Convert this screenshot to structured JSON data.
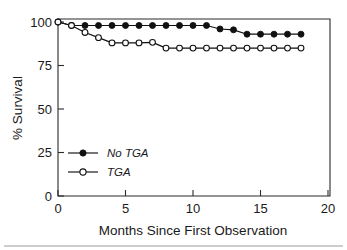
{
  "chart_data": {
    "type": "line",
    "title": "",
    "subtitle": "",
    "xlabel": "Months Since First Observation",
    "ylabel": "% Survival",
    "xlim": [
      0,
      20
    ],
    "ylim": [
      0,
      100
    ],
    "xticks": [
      0,
      5,
      10,
      15,
      20
    ],
    "xtick_labels": [
      "0",
      "5",
      "10",
      "15",
      "20"
    ],
    "yticks": [
      0,
      25,
      50,
      75,
      100
    ],
    "ytick_labels": [
      "0",
      "25",
      "50",
      "75",
      "100"
    ],
    "grid": false,
    "legend_position": "lower left",
    "x": [
      0,
      1,
      2,
      3,
      4,
      5,
      6,
      7,
      8,
      9,
      10,
      11,
      12,
      13,
      14,
      15,
      16,
      17,
      18
    ],
    "series": [
      {
        "name": "No TGA",
        "marker": "filled-circle",
        "values": [
          100,
          98,
          98,
          98,
          98,
          98,
          98,
          98,
          98,
          98,
          98,
          98,
          96,
          95.5,
          93,
          93,
          93,
          93,
          93
        ]
      },
      {
        "name": "TGA",
        "marker": "open-circle",
        "values": [
          100,
          98,
          94,
          91,
          88,
          88,
          88,
          88.3,
          85,
          85,
          85,
          85,
          85,
          85,
          85,
          85,
          85,
          85,
          85
        ]
      }
    ]
  },
  "legend": {
    "items": [
      {
        "label": "No TGA",
        "marker": "filled-circle"
      },
      {
        "label": "TGA",
        "marker": "open-circle"
      }
    ]
  },
  "axes": {
    "x_title": "Months Since First Observation",
    "y_title": "% Survival"
  }
}
